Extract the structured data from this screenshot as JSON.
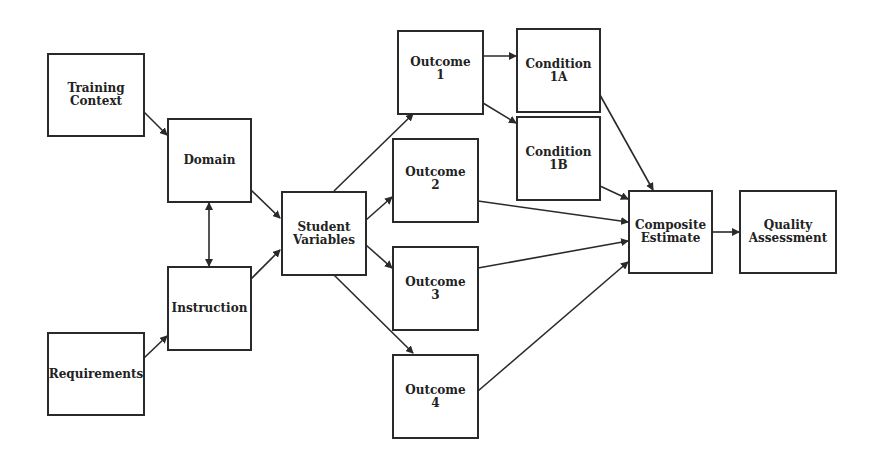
{
  "diagram": {
    "nodes": [
      {
        "id": "training-context",
        "label": "Training\nContext"
      },
      {
        "id": "requirements",
        "label": "Requirements"
      },
      {
        "id": "domain",
        "label": "Domain"
      },
      {
        "id": "instruction",
        "label": "Instruction"
      },
      {
        "id": "student-variables",
        "label": "Student\nVariables"
      },
      {
        "id": "outcome-1",
        "label": "Outcome\n1"
      },
      {
        "id": "outcome-2",
        "label": "Outcome\n2"
      },
      {
        "id": "outcome-3",
        "label": "Outcome\n3"
      },
      {
        "id": "outcome-4",
        "label": "Outcome\n4"
      },
      {
        "id": "condition-1a",
        "label": "Condition\n1A"
      },
      {
        "id": "condition-1b",
        "label": "Condition\n1B"
      },
      {
        "id": "composite-estimate",
        "label": "Composite\nEstimate"
      },
      {
        "id": "quality-assessment",
        "label": "Quality\nAssessment"
      }
    ],
    "edges": [
      {
        "from": "training-context",
        "to": "domain"
      },
      {
        "from": "requirements",
        "to": "instruction"
      },
      {
        "from": "domain",
        "to": "instruction",
        "bidirectional": true
      },
      {
        "from": "domain",
        "to": "student-variables"
      },
      {
        "from": "instruction",
        "to": "student-variables"
      },
      {
        "from": "student-variables",
        "to": "outcome-1"
      },
      {
        "from": "student-variables",
        "to": "outcome-2"
      },
      {
        "from": "student-variables",
        "to": "outcome-3"
      },
      {
        "from": "student-variables",
        "to": "outcome-4"
      },
      {
        "from": "outcome-1",
        "to": "condition-1a"
      },
      {
        "from": "outcome-1",
        "to": "condition-1b"
      },
      {
        "from": "condition-1a",
        "to": "composite-estimate"
      },
      {
        "from": "condition-1b",
        "to": "composite-estimate"
      },
      {
        "from": "outcome-2",
        "to": "composite-estimate"
      },
      {
        "from": "outcome-3",
        "to": "composite-estimate"
      },
      {
        "from": "outcome-4",
        "to": "composite-estimate"
      },
      {
        "from": "composite-estimate",
        "to": "quality-assessment"
      }
    ],
    "colors": {
      "line": "#2a2a2a",
      "background": "#ffffff"
    }
  }
}
